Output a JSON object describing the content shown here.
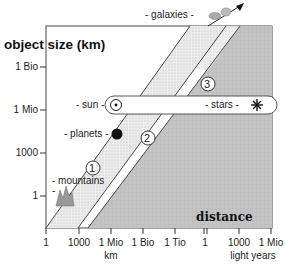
{
  "diagram": {
    "y_axis": {
      "title": "object size (km)",
      "ticks": [
        {
          "label": "1 Bio",
          "y": 67
        },
        {
          "label": "1 Mio",
          "y": 110
        },
        {
          "label": "1000",
          "y": 153
        },
        {
          "label": "1",
          "y": 196
        }
      ]
    },
    "x_axis": {
      "ticks": [
        {
          "label": "1",
          "x": 46
        },
        {
          "label": "1000",
          "x": 79
        },
        {
          "label": "1 Mio",
          "x": 111
        },
        {
          "label": "1 Bio",
          "x": 143
        },
        {
          "label": "1 Tio",
          "x": 175
        },
        {
          "label": "1",
          "x": 205
        },
        {
          "label": "1000",
          "x": 239
        },
        {
          "label": "1 Mio",
          "x": 271
        }
      ],
      "unit_km": "km",
      "unit_ly": "light years",
      "title": "distance"
    },
    "regions": [
      {
        "id": "1",
        "label": "1"
      },
      {
        "id": "2",
        "label": "2"
      },
      {
        "id": "3",
        "label": "3"
      }
    ],
    "objects": {
      "mountains": "- mountains",
      "mountains_dash": "-",
      "planets": "- planets -",
      "sun": "- sun -",
      "stars": "- stars -",
      "galaxies": "- galaxies -"
    },
    "colors": {
      "band_light": "#e6e6e6",
      "region_dark": "#bdbdbd",
      "line": "#333333",
      "planet": "#111111"
    }
  }
}
